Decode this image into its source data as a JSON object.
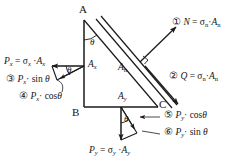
{
  "figure": {
    "background_color": "#ffffff",
    "line_color": "#1a1a1a"
  },
  "vertices": {
    "a": "A",
    "b": "B",
    "c": "C"
  },
  "angles": {
    "apex_theta": "θ",
    "left_theta": "θ",
    "bottom_theta": "θ"
  },
  "area_labels": {
    "ax": {
      "symbol": "A",
      "sub": "x"
    },
    "ay": {
      "symbol": "A",
      "sub": "y"
    },
    "an": {
      "symbol": "A",
      "sub": "n"
    }
  },
  "force_labels": [
    {
      "id": "normal-force",
      "number": "①",
      "text": "N = σₙ·Aₙ",
      "parts": {
        "lhs": "N",
        "eq": "=",
        "stress": "σ",
        "stress_sub": "n",
        "dot": "·",
        "area": "A",
        "area_sub": "n"
      }
    },
    {
      "id": "shear-force",
      "number": "②",
      "text": "Q = σₙ·Aₙ",
      "parts": {
        "lhs": "Q",
        "eq": "=",
        "stress": "σ",
        "stress_sub": "n",
        "dot": "·",
        "area": "A",
        "area_sub": "n"
      }
    },
    {
      "id": "px-sin",
      "number": "③",
      "text": "Pₓ· sin θ",
      "parts": {
        "force": "P",
        "force_sub": "x",
        "dot": "·",
        "fn": "sin",
        "angle": "θ"
      }
    },
    {
      "id": "px-cos",
      "number": "④",
      "text": "Pₓ· cosθ",
      "parts": {
        "force": "P",
        "force_sub": "x",
        "dot": "·",
        "fn": "cos",
        "angle": "θ"
      }
    },
    {
      "id": "py-cos",
      "number": "⑤",
      "text": "Pᵧ· cosθ",
      "parts": {
        "force": "P",
        "force_sub": "y",
        "dot": "·",
        "fn": "cos",
        "angle": "θ"
      }
    },
    {
      "id": "py-sin",
      "number": "⑥",
      "text": "Pᵧ· sin θ",
      "parts": {
        "force": "P",
        "force_sub": "y",
        "dot": "·",
        "fn": "sin",
        "angle": "θ"
      }
    }
  ],
  "resultant_labels": [
    {
      "id": "px-resultant",
      "text": "Pₓ = σₓ·Aₓ",
      "parts": {
        "force": "P",
        "force_sub": "x",
        "eq": "=",
        "stress": "σ",
        "stress_sub": "x",
        "dot": "·",
        "area": "A",
        "area_sub": "x"
      }
    },
    {
      "id": "py-resultant",
      "text": "Pᵧ = σᵧ·Aᵧ",
      "parts": {
        "force": "P",
        "force_sub": "y",
        "eq": "=",
        "stress": "σ",
        "stress_sub": "y",
        "dot": "·",
        "area": "A",
        "area_sub": "y"
      }
    }
  ]
}
